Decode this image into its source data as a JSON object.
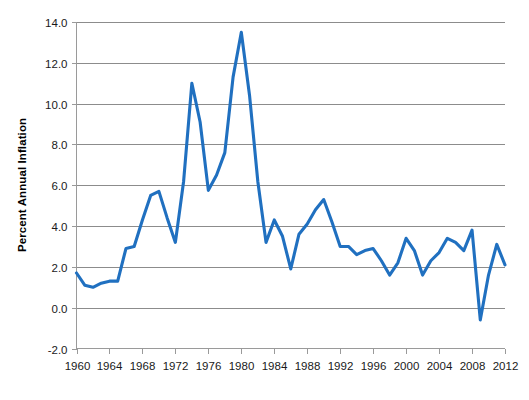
{
  "chart_data": {
    "type": "line",
    "title": "",
    "subtitle": "",
    "xlabel": "",
    "ylabel": "Percent Annual Inflation",
    "xlim": [
      1960,
      2012
    ],
    "ylim": [
      -2.0,
      14.0
    ],
    "grid": true,
    "legend": false,
    "legend_position": "none",
    "series_color": "#2070c0",
    "x_tick_labels": [
      "1960",
      "1964",
      "1968",
      "1972",
      "1976",
      "1980",
      "1984",
      "1988",
      "1992",
      "1996",
      "2000",
      "2004",
      "2008",
      "2012"
    ],
    "x_tick_values": [
      1960,
      1964,
      1968,
      1972,
      1976,
      1980,
      1984,
      1988,
      1992,
      1996,
      2000,
      2004,
      2008,
      2012
    ],
    "y_tick_labels": [
      "-2.0",
      "0.0",
      "2.0",
      "4.0",
      "6.0",
      "8.0",
      "10.0",
      "12.0",
      "14.0"
    ],
    "y_tick_values": [
      -2.0,
      0.0,
      2.0,
      4.0,
      6.0,
      8.0,
      10.0,
      12.0,
      14.0
    ],
    "series": [
      {
        "name": "Percent Annual Inflation",
        "color": "#2070c0",
        "x": [
          1960,
          1961,
          1962,
          1963,
          1964,
          1965,
          1966,
          1967,
          1968,
          1969,
          1970,
          1971,
          1972,
          1973,
          1974,
          1975,
          1976,
          1977,
          1978,
          1979,
          1980,
          1981,
          1982,
          1983,
          1984,
          1985,
          1986,
          1987,
          1988,
          1989,
          1990,
          1991,
          1992,
          1993,
          1994,
          1995,
          1996,
          1997,
          1998,
          1999,
          2000,
          2001,
          2002,
          2003,
          2004,
          2005,
          2006,
          2007,
          2008,
          2009,
          2010,
          2011,
          2012
        ],
        "values": [
          1.7,
          1.1,
          1.0,
          1.2,
          1.3,
          1.3,
          2.9,
          3.0,
          4.3,
          5.5,
          5.7,
          4.4,
          3.2,
          6.2,
          11.0,
          9.1,
          5.75,
          6.5,
          7.6,
          11.3,
          13.5,
          10.4,
          6.2,
          3.2,
          4.3,
          3.5,
          1.9,
          3.6,
          4.1,
          4.8,
          5.3,
          4.2,
          3.0,
          3.0,
          2.6,
          2.8,
          2.9,
          2.3,
          1.6,
          2.2,
          3.4,
          2.8,
          1.6,
          2.3,
          2.7,
          3.4,
          3.2,
          2.8,
          3.8,
          -0.6,
          1.6,
          3.1,
          2.1
        ]
      }
    ]
  },
  "axis": {
    "y_title": "Percent Annual Inflation"
  }
}
